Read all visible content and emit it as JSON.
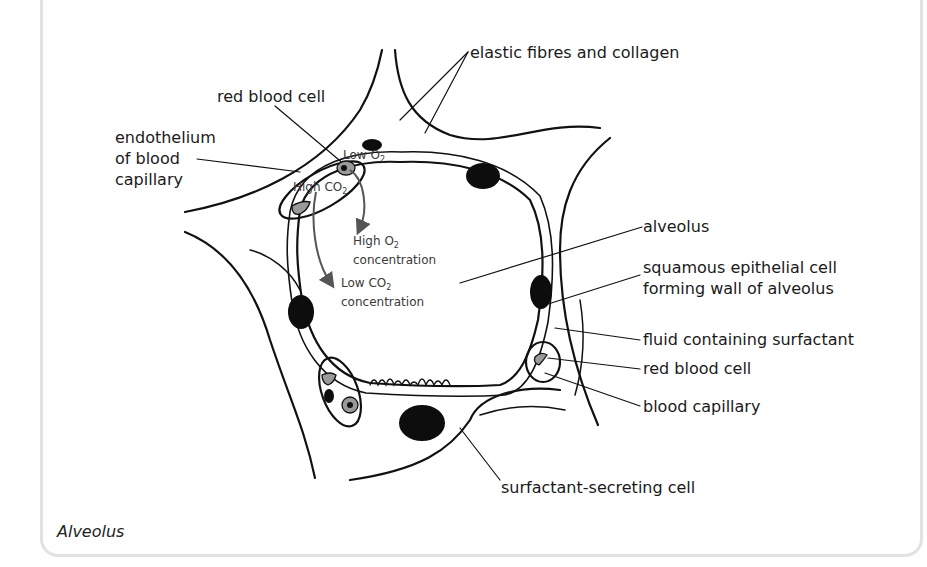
{
  "figure": {
    "caption": "Alveolus",
    "labels": {
      "elastic_fibres": "elastic fibres and collagen",
      "red_blood_cell_top": "red blood cell",
      "endothelium_line1": "endothelium",
      "endothelium_line2": "of blood",
      "endothelium_line3": "capillary",
      "alveolus": "alveolus",
      "squamous_line1": "squamous epithelial cell",
      "squamous_line2": "forming wall of alveolus",
      "fluid": "fluid containing surfactant",
      "red_blood_cell_right": "red blood cell",
      "blood_capillary": "blood capillary",
      "surfactant_cell": "surfactant-secreting cell"
    },
    "gas_annotations": {
      "low_o2": "Low O",
      "low_o2_sub": "2",
      "high_co2": "High CO",
      "high_co2_sub": "2",
      "high_o2_line1": "High O",
      "high_o2_sub": "2",
      "high_o2_line2": "concentration",
      "low_co2_line1": "Low CO",
      "low_co2_sub": "2",
      "low_co2_line2": "concentration"
    },
    "colors": {
      "outline": "#111111",
      "nucleus": "#0d0d0d",
      "rbc_fill": "#9a9a9a",
      "arrow": "#555555",
      "frame": "#e2e2e2"
    }
  }
}
